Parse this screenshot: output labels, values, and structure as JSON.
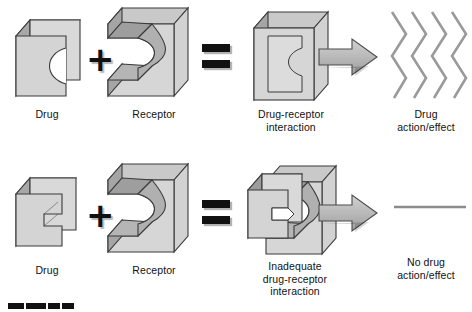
{
  "figure": {
    "background_color": "#ffffff",
    "rows": [
      {
        "id": "adequate-fit",
        "outcome": "effect",
        "items": [
          {
            "role": "drug",
            "label": "Drug",
            "shape": "block-round-notch"
          },
          {
            "role": "operator",
            "label": "+",
            "shape": "plus"
          },
          {
            "role": "receptor",
            "label": "Receptor",
            "shape": "c-block-round-tongue"
          },
          {
            "role": "operator",
            "label": "=",
            "shape": "equals"
          },
          {
            "role": "complex",
            "label": "Drug-receptor\ninteraction",
            "shape": "fused-block"
          },
          {
            "role": "operator",
            "label": "➡",
            "shape": "arrow-right"
          },
          {
            "role": "result",
            "label": "Drug\naction/effect",
            "shape": "zigzag-lines"
          }
        ]
      },
      {
        "id": "inadequate-fit",
        "outcome": "no-effect",
        "items": [
          {
            "role": "drug",
            "label": "Drug",
            "shape": "block-angular-notch"
          },
          {
            "role": "operator",
            "label": "+",
            "shape": "plus"
          },
          {
            "role": "receptor",
            "label": "Receptor",
            "shape": "c-block-round-tongue"
          },
          {
            "role": "operator",
            "label": "=",
            "shape": "equals"
          },
          {
            "role": "complex",
            "label": "Inadequate\ndrug-receptor\ninteraction",
            "shape": "mismatched-block"
          },
          {
            "role": "operator",
            "label": "➡",
            "shape": "arrow-right"
          },
          {
            "role": "result",
            "label": "No drug\naction/effect",
            "shape": "flat-line"
          }
        ]
      }
    ],
    "colors": {
      "block_face_light": "#d9d9d9",
      "block_face_mid": "#bfbfbf",
      "block_side_dark": "#999999",
      "block_top": "#cccccc",
      "outline": "#3a3a3a",
      "arrow_fill": "#b3b3b3",
      "zigzag_stroke": "#9a9a9a",
      "flatline_stroke": "#8c8c8c",
      "operator_black": "#111111",
      "text": "#111111"
    },
    "scale_bar": {
      "name": "segmented-scale-bar",
      "segments": 4,
      "visible_label": ""
    }
  }
}
